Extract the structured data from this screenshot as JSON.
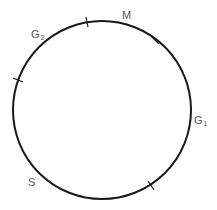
{
  "diagram": {
    "type": "cell-cycle",
    "circle": {
      "cx": 102,
      "cy": 110,
      "r": 89,
      "stroke": "#1a1a1a",
      "stroke_width": 2
    },
    "ticks": [
      {
        "id": "tick-top",
        "x": 87,
        "y": 22,
        "angle": -100
      },
      {
        "id": "tick-upper-right",
        "x": 155,
        "y": 40,
        "angle": -53
      },
      {
        "id": "tick-left",
        "x": 18,
        "y": 80,
        "angle": -160
      },
      {
        "id": "tick-lower-right",
        "x": 151,
        "y": 185,
        "angle": 57
      }
    ],
    "labels": {
      "m": {
        "main": "M",
        "sub": ""
      },
      "g2": {
        "main": "G",
        "sub": "2"
      },
      "g1": {
        "main": "G",
        "sub": "1"
      },
      "s": {
        "main": "S",
        "sub": ""
      }
    },
    "label_color": "#555555"
  }
}
